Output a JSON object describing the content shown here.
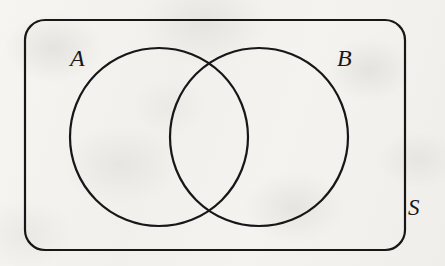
{
  "figure": {
    "kind": "venn-diagram",
    "caption": "Two overlapping sets A and B inside universal set S",
    "width": 445,
    "height": 266,
    "background_color": "#f3f2ef",
    "stroke_color": "#17171a"
  },
  "labels": {
    "universal_set": "S",
    "set_a": "A",
    "set_b": "B"
  },
  "chart_data": {
    "type": "diagram",
    "title": "",
    "subtype": "venn-2set",
    "universe": {
      "label": "S",
      "shape": "rounded-rectangle",
      "x": 25,
      "y": 20,
      "width": 380,
      "height": 230,
      "corner_radius": 20,
      "label_position": "outside-right-bottom",
      "label_x": 415,
      "label_y": 211
    },
    "sets": [
      {
        "name": "A",
        "shape": "circle",
        "cx": 159,
        "cy": 137,
        "r": 89,
        "label_x": 78,
        "label_y": 60,
        "label_position": "outside-upper-left",
        "fill": "none"
      },
      {
        "name": "B",
        "shape": "circle",
        "cx": 259,
        "cy": 137,
        "r": 89,
        "label_x": 345,
        "label_y": 60,
        "label_position": "outside-upper-right",
        "fill": "none"
      }
    ],
    "regions": [
      {
        "id": "A-only",
        "shaded": false
      },
      {
        "id": "B-only",
        "shaded": false
      },
      {
        "id": "A-intersect-B",
        "shaded": false
      },
      {
        "id": "outside-both",
        "shaded": false
      }
    ],
    "intersection_points": [
      {
        "x": 209,
        "y": 58
      },
      {
        "x": 209,
        "y": 216
      }
    ],
    "stroke_width": 2,
    "grid": false,
    "legend": "none"
  }
}
